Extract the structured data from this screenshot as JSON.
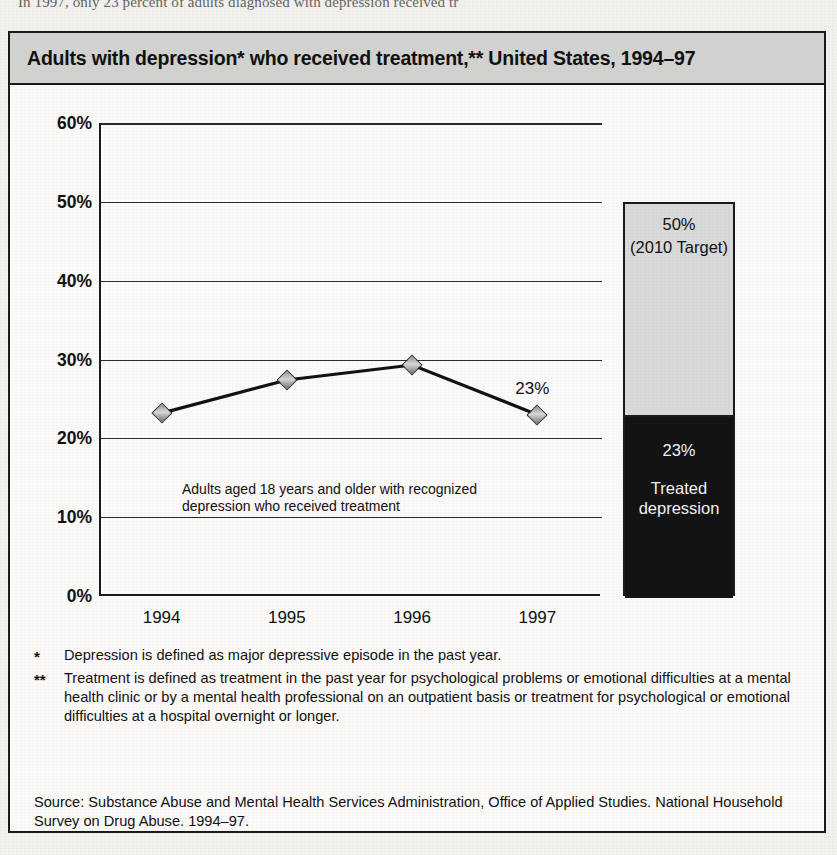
{
  "page": {
    "cutoff_text_above_figure": "In 1997, only 23 percent of adults diagnosed with depression received tr"
  },
  "figure": {
    "title": "Adults with depression* who received treatment,** United States, 1994–97",
    "footnotes": [
      {
        "mark": "*",
        "text": "Depression is defined as major depressive episode in the past year."
      },
      {
        "mark": "**",
        "text": "Treatment is defined as treatment in the past year for psychological problems or emotional difficulties at a mental health clinic or by a mental health professional on an outpatient basis or treatment for psychological or emotional difficulties at a hospital overnight or longer."
      }
    ],
    "source": "Source:  Substance Abuse and Mental Health Services Administration, Office of Applied Studies. National Household Survey on Drug Abuse. 1994–97."
  },
  "colors": {
    "header_band": "#d2d2d0",
    "bar_target_fill": "#d9d9d9",
    "bar_treated_fill": "#131313",
    "line_stroke": "#111111",
    "marker_fill": "#b0b0b0",
    "border": "#1a1a1a",
    "page_background": "#f2f1ee"
  },
  "chart_data": {
    "type": "line",
    "title": "Adults with depression* who received treatment,** United States, 1994–97",
    "xlabel": "",
    "ylabel": "",
    "ylim": [
      0,
      60
    ],
    "yticks": [
      "0%",
      "10%",
      "20%",
      "30%",
      "40%",
      "50%",
      "60%"
    ],
    "ytick_values": [
      0,
      10,
      20,
      30,
      40,
      50,
      60
    ],
    "grid": true,
    "legend_position": "none",
    "categories": [
      "1994",
      "1995",
      "1996",
      "1997"
    ],
    "series": [
      {
        "name": "Adults aged 18 years and older with recognized depression who received treatment",
        "values": [
          23.2,
          27.4,
          29.3,
          23.0
        ],
        "marker": "diamond",
        "point_labels": [
          null,
          null,
          null,
          "23%"
        ]
      }
    ],
    "annotations": [
      {
        "text": "Adults aged 18 years and older with recognized\ndepression who received treatment",
        "x": "1994.4",
        "y": 18.5
      }
    ],
    "companion_bar": {
      "type": "bar",
      "total": 50,
      "segments": [
        {
          "name": "Treated depression",
          "value": 23,
          "value_label": "23%",
          "text_label": "Treated\ndepression",
          "fill": "#131313"
        },
        {
          "name": "2010 Target",
          "value": 27,
          "value_label": "50%",
          "text_label": "(2010 Target)",
          "fill": "#d9d9d9",
          "cumulative_top": 50
        }
      ]
    }
  }
}
